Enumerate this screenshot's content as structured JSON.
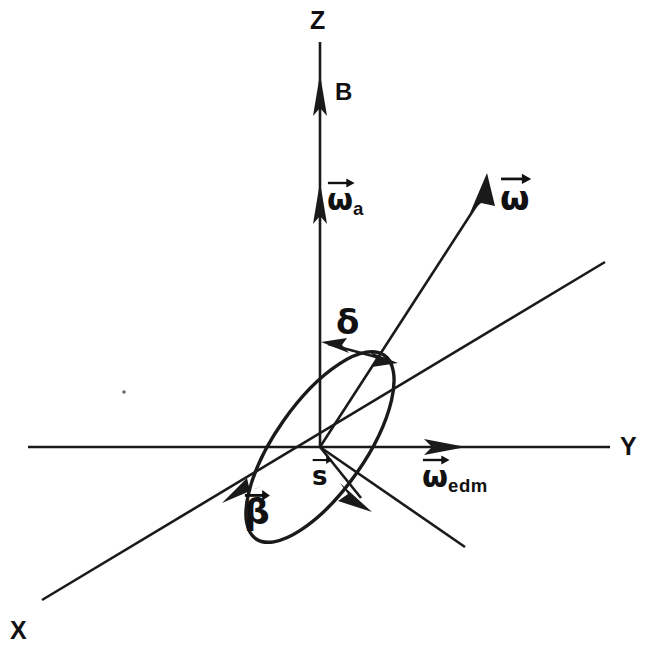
{
  "figure": {
    "background_color": "#ffffff",
    "ink_color": "#1a1a1a",
    "width": 649,
    "height": 659
  },
  "axes": [
    {
      "name": "z-axis",
      "label": "Z",
      "direction": "vertical-up",
      "label_x": 310,
      "label_y": 8
    },
    {
      "name": "y-axis",
      "label": "Y",
      "direction": "horizontal-right",
      "label_x": 620,
      "label_y": 434
    },
    {
      "name": "x-axis",
      "label": "X",
      "direction": "oblique-lower-left",
      "label_x": 10,
      "label_y": 618
    }
  ],
  "vectors": [
    {
      "name": "magnetic-field",
      "label": "B",
      "accent": false,
      "along": "z-axis",
      "label_x": 335,
      "label_y": 80
    },
    {
      "name": "omega-a",
      "glyph": "ω",
      "subscript": "a",
      "accent": true,
      "along": "z-axis",
      "label_x": 327,
      "label_y": 185
    },
    {
      "name": "omega-total",
      "glyph": "ω",
      "subscript": "",
      "accent": true,
      "label_x": 500,
      "label_y": 181
    },
    {
      "name": "omega-edm",
      "glyph": "ω",
      "subscript": "edm",
      "accent": true,
      "along": "y-axis",
      "label_x": 422,
      "label_y": 462
    },
    {
      "name": "spin",
      "glyph": "s",
      "subscript": "",
      "accent": true,
      "label_x": 312,
      "label_y": 463
    },
    {
      "name": "beta-velocity",
      "glyph": "β",
      "subscript": "",
      "accent": true,
      "label_x": 244,
      "label_y": 494
    }
  ],
  "angles": [
    {
      "name": "delta-angle",
      "label": "δ",
      "between": [
        "z-axis",
        "omega-total"
      ],
      "label_x": 336,
      "label_y": 305,
      "arc_arrow": "double-headed"
    }
  ],
  "shapes": [
    {
      "name": "precession-cone-ellipse",
      "type": "ellipse",
      "center_x": 320,
      "center_y": 447,
      "rx": 112,
      "ry": 45,
      "rotation_deg": -55
    }
  ],
  "geometry": {
    "origin_x": 320,
    "origin_y": 447,
    "z_top_y": 42,
    "y_left_x": 28,
    "y_right_x": 610,
    "x_upper_right": [
      605,
      262
    ],
    "x_lower_left": [
      40,
      600
    ]
  }
}
